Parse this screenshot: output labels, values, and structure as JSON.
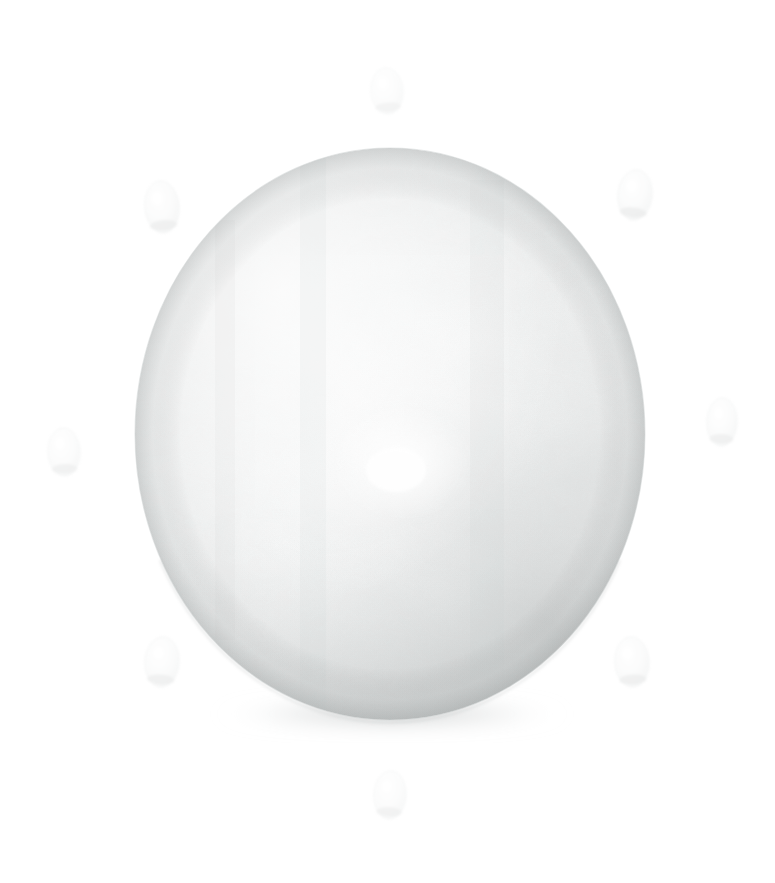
{
  "canvas": {
    "width": 775,
    "height": 883,
    "background_color": "#ffffff",
    "subject": "pale-white-spherical-object-with-small-floating-ovoids",
    "alt_text": "A large pale off-white sphere with faint speckled texture centered on a plain white background, surrounded by eight small translucent ovoid shapes arranged radially around it."
  },
  "main_object": {
    "name": "large-sphere",
    "shape": "ellipse",
    "center_x": 390,
    "center_y": 434,
    "radius_x": 255,
    "radius_y": 286,
    "bounds": {
      "left": 135,
      "top": 148,
      "right": 645,
      "bottom": 720
    },
    "base_color": "#f2f3f3",
    "highlight_color": "#ffffff",
    "highlight_x": 402,
    "highlight_y": 462,
    "mid_tone_color": "#e6e8e8",
    "shadow_color": "#c9cccc",
    "rim_color": "#bfc3c3",
    "texture": "fine-speckled-pores",
    "surface_finish": "matte-chalky"
  },
  "contact_shadow": {
    "name": "bottom-contact-shadow",
    "center_x": 392,
    "center_y": 714,
    "radius_x": 178,
    "radius_y": 16,
    "color": "#b9bdbd"
  },
  "satellites": [
    {
      "id": "satellite-top",
      "cx": 387,
      "cy": 91,
      "rx": 16,
      "ry": 23,
      "rotation": -4,
      "opacity": 0.3,
      "fill": "#eef0f0"
    },
    {
      "id": "satellite-upper-right",
      "cx": 635,
      "cy": 195,
      "rx": 17,
      "ry": 25,
      "rotation": 6,
      "opacity": 0.42,
      "fill": "#eaecec"
    },
    {
      "id": "satellite-right",
      "cx": 722,
      "cy": 422,
      "rx": 15,
      "ry": 24,
      "rotation": 2,
      "opacity": 0.38,
      "fill": "#ebeded"
    },
    {
      "id": "satellite-lower-right",
      "cx": 632,
      "cy": 662,
      "rx": 17,
      "ry": 25,
      "rotation": -3,
      "opacity": 0.4,
      "fill": "#eaecec"
    },
    {
      "id": "satellite-bottom",
      "cx": 390,
      "cy": 795,
      "rx": 16,
      "ry": 24,
      "rotation": 3,
      "opacity": 0.34,
      "fill": "#edefef"
    },
    {
      "id": "satellite-lower-left",
      "cx": 162,
      "cy": 662,
      "rx": 17,
      "ry": 25,
      "rotation": 4,
      "opacity": 0.38,
      "fill": "#ebeded"
    },
    {
      "id": "satellite-left",
      "cx": 64,
      "cy": 452,
      "rx": 16,
      "ry": 24,
      "rotation": -2,
      "opacity": 0.36,
      "fill": "#ecefef"
    },
    {
      "id": "satellite-upper-left",
      "cx": 162,
      "cy": 207,
      "rx": 17,
      "ry": 26,
      "rotation": -5,
      "opacity": 0.4,
      "fill": "#eaecec"
    }
  ],
  "satellite_shadow_color": "#c8cbcb",
  "labels": {
    "scene_title": "",
    "figure_caption": ""
  }
}
